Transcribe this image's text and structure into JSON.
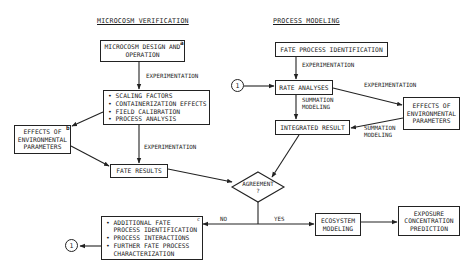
{
  "sections": {
    "left_title": "MICROCOSM VERIFICATION",
    "right_title": "PROCESS MODELING"
  },
  "nodes": {
    "microcosm_design": {
      "line1": "MICROCOSM DESIGN AND",
      "line2": "OPERATION",
      "note": "a"
    },
    "factors": {
      "items": [
        "• SCALING FACTORS",
        "• CONTAINERIZATION EFFECTS",
        "• FIELD CALIBRATION",
        "• PROCESS ANALYSIS"
      ]
    },
    "effects_left": {
      "line1": "EFFECTS OF",
      "line2": "ENVIRONMENTAL",
      "line3": "PARAMETERS",
      "note": "b"
    },
    "fate_results": {
      "label": "FATE RESULTS"
    },
    "agreement": {
      "line1": "AGREEMENT",
      "line2": "?"
    },
    "additional": {
      "items": [
        "• ADDITIONAL FATE",
        "  PROCESS IDENTIFICATION",
        "• PROCESS INTERACTIONS",
        "• FURTHER FATE PROCESS",
        "  CHARACTERIZATION"
      ],
      "note": "c"
    },
    "connector_bottom": {
      "label": "1"
    },
    "fate_process_id": {
      "label": "FATE PROCESS IDENTIFICATION"
    },
    "connector_top": {
      "label": "1"
    },
    "rate_analyses": {
      "label": "RATE ANALYSES"
    },
    "effects_right": {
      "line1": "EFFECTS OF",
      "line2": "ENVIRONMENTAL",
      "line3": "PARAMETERS"
    },
    "integrated_result": {
      "label": "INTEGRATED RESULT"
    },
    "ecosystem": {
      "line1": "ECOSYSTEM",
      "line2": "MODELING"
    },
    "exposure": {
      "line1": "EXPOSURE",
      "line2": "CONCENTRATION",
      "line3": "PREDICTION"
    }
  },
  "edge_labels": {
    "exp_left_1": "EXPERIMENTATION",
    "exp_left_2": "EXPERIMENTATION",
    "exp_right_1": "EXPERIMENTATION",
    "exp_right_2": "EXPERIMENTATION",
    "sum_mod_1a": "SUMMATION",
    "sum_mod_1b": "MODELING",
    "sum_mod_2a": "SUMMATION",
    "sum_mod_2b": "MODELING",
    "no": "NO",
    "yes": "YES"
  }
}
